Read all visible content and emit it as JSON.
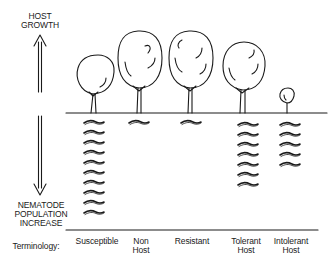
{
  "axis": {
    "top_label_line1": "HOST",
    "top_label_line2": "GROWTH",
    "bottom_label_line1": "NEMATODE",
    "bottom_label_line2": "POPULATION",
    "bottom_label_line3": "INCREASE"
  },
  "terminology_label": "Terminology:",
  "categories": [
    {
      "line1": "Susceptible",
      "line2": "",
      "tree_size": "medium",
      "nematodes": 10
    },
    {
      "line1": "Non",
      "line2": "Host",
      "tree_size": "large",
      "nematodes": 1
    },
    {
      "line1": "Resistant",
      "line2": "",
      "tree_size": "large",
      "nematodes": 1
    },
    {
      "line1": "Tolerant",
      "line2": "Host",
      "tree_size": "medium-large",
      "nematodes": 7
    },
    {
      "line1": "Intolerant",
      "line2": "Host",
      "tree_size": "small",
      "nematodes": 5
    }
  ],
  "icons": {
    "arrow": "double-headed-vertical-arrow",
    "tree": "tree-icon",
    "nematode": "nematode-worm-icon"
  },
  "colors": {
    "ink": "#1a1a1a",
    "background": "#ffffff"
  }
}
